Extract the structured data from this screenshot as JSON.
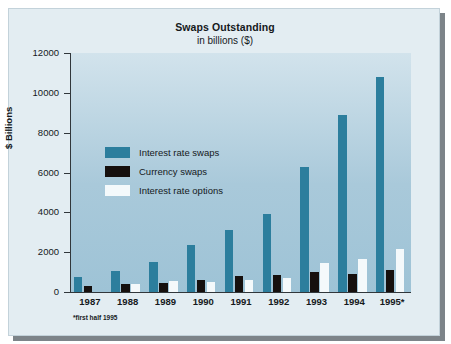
{
  "chart_data": {
    "type": "bar",
    "title": "Swaps Outstanding",
    "subtitle": "in billions ($)",
    "xlabel": "",
    "ylabel": "$ Billions",
    "ylim": [
      0,
      12000
    ],
    "yticks": [
      0,
      2000,
      4000,
      6000,
      8000,
      10000,
      12000
    ],
    "ytick_labels": [
      "0",
      "2000",
      "4000",
      "6000",
      "8000",
      "10000",
      "12000"
    ],
    "grid": false,
    "legend_position": "upper left inside plot",
    "categories": [
      "1987",
      "1988",
      "1989",
      "1990",
      "1991",
      "1992",
      "1993",
      "1994",
      "1995*"
    ],
    "series": [
      {
        "name": "Interest rate swaps",
        "color": "#2c7e9d",
        "values": [
          750,
          1050,
          1500,
          2350,
          3100,
          3900,
          6300,
          8900,
          10800
        ]
      },
      {
        "name": "Currency swaps",
        "color": "#16100e",
        "values": [
          300,
          400,
          450,
          600,
          800,
          850,
          1000,
          900,
          1100
        ]
      },
      {
        "name": "Interest rate options",
        "color": "#f4f9fb",
        "values": [
          0,
          400,
          550,
          500,
          600,
          700,
          1450,
          1650,
          2150
        ]
      }
    ],
    "annotations": [
      "*first half 1995"
    ]
  },
  "legend": {
    "items": [
      {
        "label": "Interest rate swaps",
        "color": "#2c7e9d"
      },
      {
        "label": "Currency swaps",
        "color": "#16100e"
      },
      {
        "label": "Interest rate options",
        "color": "#f4f9fb"
      }
    ]
  },
  "footnote": "*first half 1995",
  "colors": {
    "accent_teal": "#2c7e9d",
    "dark": "#16100e",
    "light": "#f4f9fb",
    "plot_background": "#a9c9da",
    "card_background": "#e3edf2",
    "shadow": "#7d8489"
  }
}
